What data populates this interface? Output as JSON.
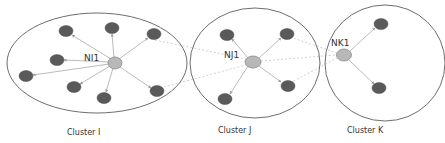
{
  "diagram": {
    "type": "cluster-network",
    "colors": {
      "member_node": "#5a5a5a",
      "head_node": "#b8b8b8",
      "boundary": "#6e6e6e",
      "edge": "#a8a8a8",
      "inter_edge": "#c4c4c4"
    },
    "clusters": [
      {
        "id": "I",
        "label": "Cluster I",
        "head": {
          "label": "NI1"
        },
        "member_count": 8
      },
      {
        "id": "J",
        "label": "Cluster J",
        "head": {
          "label": "NJ1"
        },
        "member_count": 4
      },
      {
        "id": "K",
        "label": "Cluster K",
        "head": {
          "label": "NK1"
        },
        "member_count": 2
      }
    ],
    "inter_cluster_links": [
      {
        "from": "NI1",
        "to": "NJ1",
        "style": "dashed"
      },
      {
        "from": "NJ1",
        "to": "NK1",
        "style": "dashed"
      }
    ]
  }
}
